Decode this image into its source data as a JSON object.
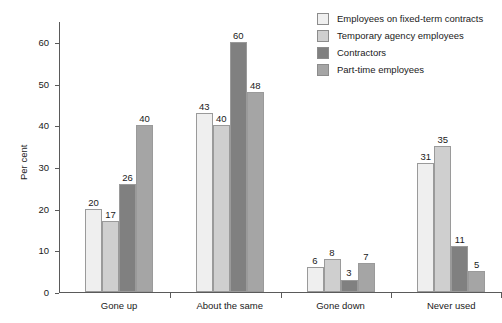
{
  "chart_data": {
    "type": "bar",
    "title": "",
    "xlabel": "",
    "ylabel": "Per cent",
    "ylim": [
      0,
      65
    ],
    "yticks": [
      0,
      10,
      20,
      30,
      40,
      50,
      60
    ],
    "grid": false,
    "legend_position": "top-right",
    "categories": [
      "Gone up",
      "About the same",
      "Gone down",
      "Never used"
    ],
    "series": [
      {
        "name": "Employees on fixed-term contracts",
        "color": "#efefef",
        "values": [
          20,
          43,
          6,
          31
        ]
      },
      {
        "name": "Temporary agency employees",
        "color": "#cfcfcf",
        "values": [
          17,
          40,
          8,
          35
        ]
      },
      {
        "name": "Contractors",
        "color": "#808080",
        "values": [
          26,
          60,
          3,
          11
        ]
      },
      {
        "name": "Part-time employees",
        "color": "#a5a5a5",
        "values": [
          40,
          48,
          7,
          5
        ]
      }
    ]
  }
}
